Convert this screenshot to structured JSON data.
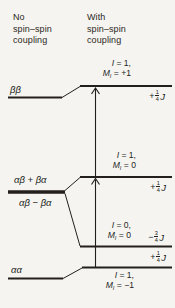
{
  "colors": {
    "background": "#f6f4f0",
    "ink": "#221f1c"
  },
  "headers": {
    "no_coupling": {
      "line1": "No",
      "line2": "spin–spin",
      "line3": "coupling"
    },
    "with_coupling": {
      "line1": "With",
      "line2": "spin–spin",
      "line3": "coupling"
    }
  },
  "uncoupled_levels": {
    "beta_beta": "ββ",
    "alphabeta_plus": "αβ + βα",
    "alphabeta_minus": "αβ − βα",
    "alpha_alpha": "αα"
  },
  "coupled_levels": {
    "m_plus1": {
      "i": "I",
      "i_rest": " = 1,",
      "m": "M",
      "m_sub": "I",
      "m_rest": " = +1"
    },
    "m0_triplet": {
      "i": "I",
      "i_rest": " = 1,",
      "m": "M",
      "m_sub": "I",
      "m_rest": " = 0"
    },
    "m0_singlet": {
      "i": "I",
      "i_rest": " = 0,",
      "m": "M",
      "m_sub": "I",
      "m_rest": " = 0"
    },
    "m_minus1": {
      "i": "I",
      "i_rest": " = 1,",
      "m": "M",
      "m_sub": "I",
      "m_rest": " = −1"
    }
  },
  "energy_shifts": {
    "top": {
      "sign": "+",
      "num": "1",
      "den": "4",
      "symbol": "J"
    },
    "middle": {
      "sign": "+",
      "num": "1",
      "den": "4",
      "symbol": "J"
    },
    "singlet": {
      "sign": "−",
      "num": "3",
      "den": "4",
      "symbol": "J"
    },
    "bottom": {
      "sign": "+",
      "num": "1",
      "den": "4",
      "symbol": "J"
    }
  }
}
